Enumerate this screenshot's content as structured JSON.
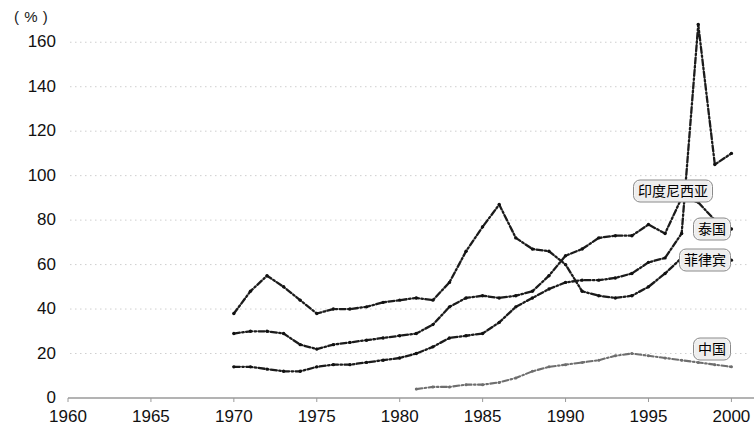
{
  "chart_data": {
    "type": "line",
    "title": "",
    "subtitle": "",
    "xlabel": "",
    "ylabel": "",
    "unit_label": "( % )",
    "xlim": [
      1960,
      2001
    ],
    "ylim": [
      0,
      170
    ],
    "xticks": [
      1960,
      1965,
      1970,
      1975,
      1980,
      1985,
      1990,
      1995,
      2000
    ],
    "yticks": [
      0,
      20,
      40,
      60,
      80,
      100,
      120,
      140,
      160
    ],
    "grid": "horizontal-dotted",
    "legend_position": "inline-right-labels",
    "series": [
      {
        "name": "印度尼西亚",
        "label_color": "#111111",
        "line_style": "dash-dot",
        "x": [
          1970,
          1971,
          1972,
          1973,
          1974,
          1975,
          1976,
          1977,
          1978,
          1979,
          1980,
          1981,
          1982,
          1983,
          1984,
          1985,
          1986,
          1987,
          1988,
          1989,
          1990,
          1991,
          1992,
          1993,
          1994,
          1995,
          1996,
          1997,
          1998,
          1999,
          2000
        ],
        "values": [
          14,
          14,
          13,
          12,
          12,
          14,
          15,
          15,
          16,
          17,
          18,
          20,
          23,
          27,
          28,
          29,
          34,
          41,
          45,
          49,
          52,
          53,
          53,
          54,
          56,
          61,
          63,
          74,
          168,
          105,
          110
        ]
      },
      {
        "name": "泰国",
        "label_color": "#111111",
        "line_style": "dash-dot",
        "x": [
          1970,
          1971,
          1972,
          1973,
          1974,
          1975,
          1976,
          1977,
          1978,
          1979,
          1980,
          1981,
          1982,
          1983,
          1984,
          1985,
          1986,
          1987,
          1988,
          1989,
          1990,
          1991,
          1992,
          1993,
          1994,
          1995,
          1996,
          1997,
          1998,
          1999,
          2000
        ],
        "values": [
          29,
          30,
          30,
          29,
          24,
          22,
          24,
          25,
          26,
          27,
          28,
          29,
          33,
          41,
          45,
          46,
          45,
          46,
          48,
          55,
          64,
          67,
          72,
          73,
          73,
          78,
          74,
          90,
          88,
          80,
          76
        ]
      },
      {
        "name": "菲律宾",
        "label_color": "#111111",
        "line_style": "dash-dot",
        "x": [
          1970,
          1971,
          1972,
          1973,
          1974,
          1975,
          1976,
          1977,
          1978,
          1979,
          1980,
          1981,
          1982,
          1983,
          1984,
          1985,
          1986,
          1987,
          1988,
          1989,
          1990,
          1991,
          1992,
          1993,
          1994,
          1995,
          1996,
          1997,
          1998,
          1999,
          2000
        ],
        "values": [
          38,
          48,
          55,
          50,
          44,
          38,
          40,
          40,
          41,
          43,
          44,
          45,
          44,
          52,
          66,
          77,
          87,
          72,
          67,
          66,
          60,
          48,
          46,
          45,
          46,
          50,
          56,
          63,
          58,
          62,
          62
        ]
      },
      {
        "name": "中国",
        "label_color": "#555555",
        "line_style": "dash-dot-light",
        "x": [
          1981,
          1982,
          1983,
          1984,
          1985,
          1986,
          1987,
          1988,
          1989,
          1990,
          1991,
          1992,
          1993,
          1994,
          1995,
          1996,
          1997,
          1998,
          1999,
          2000
        ],
        "values": [
          4,
          5,
          5,
          6,
          6,
          7,
          9,
          12,
          14,
          15,
          16,
          17,
          19,
          20,
          19,
          18,
          17,
          16,
          15,
          14
        ]
      }
    ],
    "annotations": [
      {
        "text": "印度尼西亚",
        "x": 1998.9,
        "y": 93
      },
      {
        "text": "泰国",
        "x": 2000.0,
        "y": 76
      },
      {
        "text": "菲律宾",
        "x": 2000.0,
        "y": 62
      },
      {
        "text": "中国",
        "x": 2000.0,
        "y": 22
      }
    ]
  }
}
